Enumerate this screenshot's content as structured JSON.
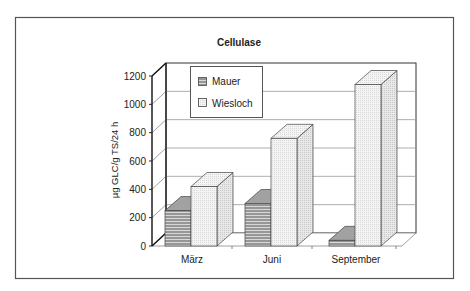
{
  "chart_data": {
    "type": "bar",
    "style": "3d-clustered",
    "title": "Cellulase",
    "xlabel": "",
    "ylabel": "µg GLC/g TS/24 h",
    "ylim": [
      0,
      1200
    ],
    "yticks": [
      0,
      200,
      400,
      600,
      800,
      1000,
      1200
    ],
    "grid": true,
    "legend_position": "upper-left-inside",
    "categories": [
      "März",
      "Juni",
      "September"
    ],
    "series": [
      {
        "name": "Mauer",
        "pattern": "horizontal-hatch",
        "values": [
          250,
          300,
          40
        ]
      },
      {
        "name": "Wiesloch",
        "pattern": "light-dots",
        "values": [
          420,
          760,
          1140
        ]
      }
    ]
  },
  "legend": {
    "items": [
      {
        "label": "Mauer",
        "icon": "hatched-swatch-icon"
      },
      {
        "label": "Wiesloch",
        "icon": "dotted-swatch-icon"
      }
    ]
  },
  "colors": {
    "frame": "#555555",
    "axis": "#222222",
    "grid": "#999999",
    "mauer_fill": "#cfcfcf",
    "mauer_hatch": "#555555",
    "wiesloch_fill": "#f2f2f2",
    "wiesloch_side": "#e2e2e2"
  }
}
